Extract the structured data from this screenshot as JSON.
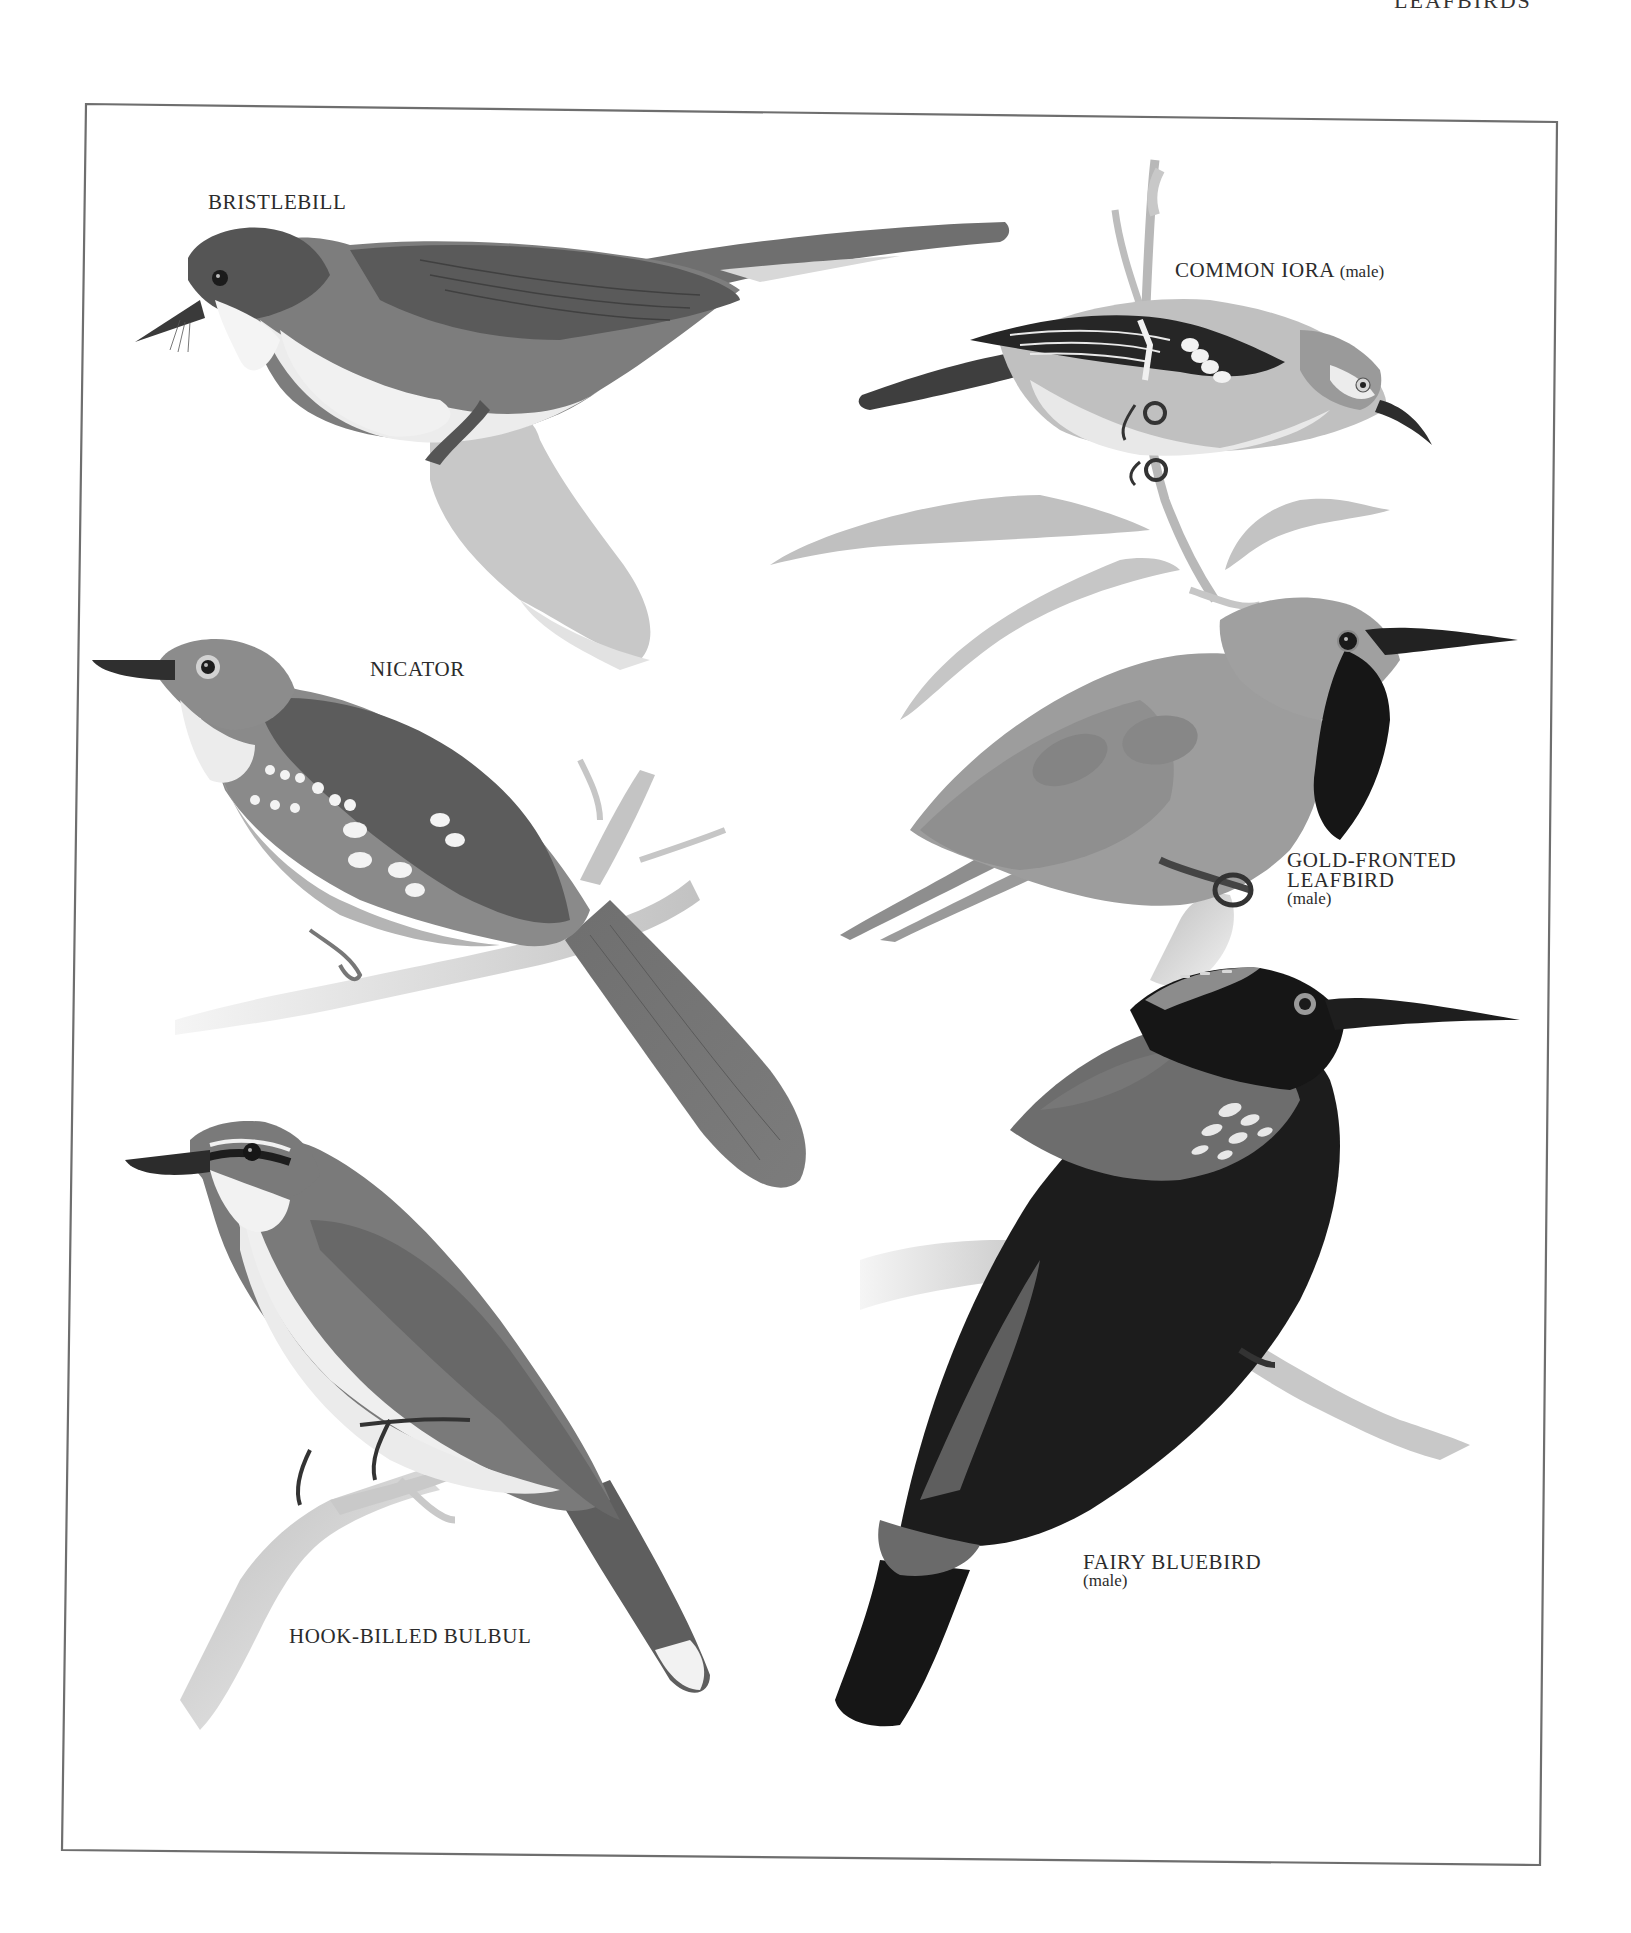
{
  "page": {
    "running_head": "LEAFBIRDS",
    "background_color": "#ffffff",
    "frame_color": "#6e6e6e"
  },
  "plate": {
    "style": "grayscale painted illustrations",
    "birds": [
      {
        "id": "bristlebill",
        "name": "BRISTLEBILL",
        "qualifier": ""
      },
      {
        "id": "common-iora",
        "name": "COMMON IORA",
        "qualifier": "(male)"
      },
      {
        "id": "nicator",
        "name": "NICATOR",
        "qualifier": ""
      },
      {
        "id": "gold-fronted-leafbird",
        "name_line1": "GOLD-FRONTED",
        "name_line2": "LEAFBIRD",
        "qualifier": "(male)"
      },
      {
        "id": "fairy-bluebird",
        "name": "FAIRY BLUEBIRD",
        "qualifier": "(male)"
      },
      {
        "id": "hook-billed-bulbul",
        "name": "HOOK-BILLED BULBUL",
        "qualifier": ""
      }
    ]
  },
  "colors": {
    "ink_dark": "#1a1a1a",
    "plumage_dark": "#4a4a4a",
    "plumage_mid": "#7a7a7a",
    "plumage_light": "#a5a5a5",
    "belly_white": "#efefef",
    "branch": "#c4c4c4"
  }
}
